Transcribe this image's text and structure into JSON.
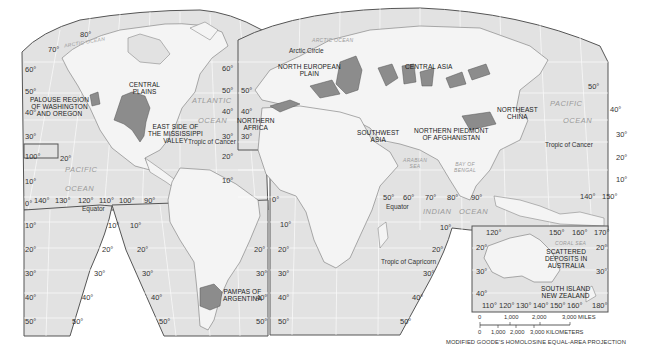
{
  "map": {
    "projection": "MODIFIED GOODE'S HOMOLOSINE EQUAL-AREA PROJECTION",
    "colors": {
      "background": "#ffffff",
      "ocean": "#e2e2e2",
      "land": "#f4f4f4",
      "highlight_region": "#8c8c8c",
      "border": "#555555",
      "graticule": "#ffffff",
      "ocean_text": "#9a9a9a"
    },
    "regions": [
      {
        "id": "palouse",
        "label": "PALOUSE REGION\nOF WASHINGTON\nAND OREGON"
      },
      {
        "id": "central-plains",
        "label": "CENTRAL\nPLAINS"
      },
      {
        "id": "east-mississippi",
        "label": "EAST SIDE OF\nTHE MISSISSIPPI\nVALLEY"
      },
      {
        "id": "pampas",
        "label": "PAMPAS OF\nARGENTINA"
      },
      {
        "id": "north-european-plain",
        "label": "NORTH EUROPEAN\nPLAIN"
      },
      {
        "id": "northern-africa",
        "label": "NORTHERN\nAFRICA"
      },
      {
        "id": "southwest-asia",
        "label": "SOUTHWEST\nASIA"
      },
      {
        "id": "afghanistan",
        "label": "NORTHERN PIEDMONT\nOF AFGHANISTAN"
      },
      {
        "id": "central-asia",
        "label": "CENTRAL ASIA"
      },
      {
        "id": "northeast-china",
        "label": "NORTHEAST\nCHINA"
      },
      {
        "id": "australia",
        "label": "SCATTERED\nDEPOSITS IN\nAUSTRALIA"
      },
      {
        "id": "new-zealand",
        "label": "SOUTH ISLAND\nNEW ZEALAND"
      }
    ],
    "oceans": {
      "arctic_left": "ARCTIC OCEAN",
      "arctic_right": "ARCTIC OCEAN",
      "atlantic": "ATLANTIC",
      "atlantic_ocean": "OCEAN",
      "pacific_left": "PACIFIC",
      "pacific_left_ocean": "OCEAN",
      "pacific_right": "PACIFIC",
      "pacific_right_ocean": "OCEAN",
      "indian": "INDIAN",
      "indian_ocean": "OCEAN",
      "arabian_sea": "ARABIAN\nSEA",
      "bay_of_bengal": "BAY OF\nBENGAL",
      "coral_sea": "CORAL SEA"
    },
    "lines": {
      "arctic_circle": "Arctic Circle",
      "tropic_cancer_left": "Tropic of Cancer",
      "tropic_cancer_right": "Tropic of Cancer",
      "equator_left": "Equator",
      "equator_right": "Equator",
      "tropic_capricorn": "Tropic of Capricorn"
    },
    "latitudes": {
      "l80": "80°",
      "l70": "70°",
      "l60a": "60°",
      "l50a": "50°",
      "l40a": "40°",
      "l30a": "30°",
      "l60b": "60°",
      "l50b": "50°",
      "l40b": "40°",
      "l30b": "30°",
      "l20b": "20°",
      "l10b": "10°",
      "l50c": "50°",
      "l40c": "40°",
      "l30c": "30°",
      "l20c": "20°",
      "l10c": "10°",
      "l50d": "50°",
      "l40d": "40°",
      "l30e": "30°",
      "l20e": "20°",
      "l10e": "10°",
      "l20box": "20°",
      "l100box": "100°",
      "l10f": "10°",
      "l0f": "0°",
      "s10a": "10°",
      "s20a": "20°",
      "s30a": "30°",
      "s40a": "40°",
      "s50a": "50°",
      "s10b": "10°",
      "s20b": "20°",
      "s30b": "30°",
      "s40b": "40°",
      "s50b": "50°",
      "s10c": "10°",
      "s20c": "20°",
      "s30c": "30°",
      "s40c": "40°",
      "s50c": "50°",
      "s20d": "20°",
      "s30d": "30°",
      "s40d": "40°",
      "s50d": "50°",
      "s10e": "10°",
      "s20e": "20°",
      "s30e": "30°",
      "s40e": "40°",
      "s50e": "50°",
      "s10f": "10°",
      "s20f": "20°",
      "s30f": "30°",
      "s40f": "40°",
      "s50f": "50°",
      "s10g": "10°",
      "s20g": "20°",
      "s30g": "30°",
      "s40g": "40°",
      "s50g": "50°",
      "s10h": "10°",
      "s20h": "20°",
      "s30h": "30°",
      "n0": "0°",
      "s10i": "10°"
    },
    "longitudes_equator_left": [
      "140°",
      "130°",
      "120°",
      "110°",
      "100°",
      "90°"
    ],
    "longitudes_equator_right": [
      "50°",
      "60°",
      "70°",
      "80°",
      "90°"
    ],
    "longitudes_pacific_right": [
      "140°",
      "150°"
    ],
    "inset": {
      "top_lons": [
        "120°",
        "150°",
        "160°",
        "170°"
      ],
      "bottom_lons": [
        "110°",
        "120°",
        "130°",
        "140°",
        "150°",
        "160°",
        "180°"
      ],
      "lats_left": [
        "20°",
        "30°",
        "40°"
      ],
      "lats_right": [
        "20°",
        "30°"
      ]
    },
    "scale": {
      "miles_ticks": [
        "0",
        "1,000",
        "2,000",
        "3,000 MILES"
      ],
      "km_ticks": [
        "0",
        "1,000",
        "2,000",
        "3,000 KILOMETERS"
      ]
    }
  }
}
